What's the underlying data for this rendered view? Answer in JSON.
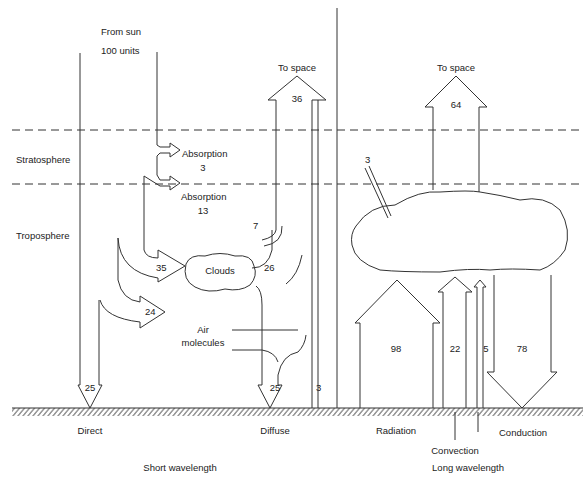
{
  "source": {
    "from_label": "From sun",
    "units_label": "100 units"
  },
  "layers": {
    "stratosphere": "Stratosphere",
    "troposphere": "Troposphere"
  },
  "short_wave": {
    "absorption_strat_label": "Absorption",
    "absorption_strat_value": "3",
    "absorption_trop_label": "Absorption",
    "absorption_trop_value": "13",
    "to_space_label": "To space",
    "to_space_value": "36",
    "cloud_reflect_value": "7",
    "to_clouds_value": "35",
    "clouds_label": "Clouds",
    "cloud_diffuse_value": "26",
    "to_air_value": "24",
    "air_label_1": "Air",
    "air_label_2": "molecules",
    "direct_value": "25",
    "diffuse_value": "25",
    "surface_reflect_value": "3",
    "direct_label": "Direct",
    "diffuse_label": "Diffuse",
    "section_label": "Short wavelength"
  },
  "long_wave": {
    "to_space_label": "To space",
    "to_space_value": "64",
    "absorbed_value": "3",
    "radiation_value": "98",
    "convection_value": "22",
    "conduction_value": "5",
    "back_radiation_value": "78",
    "radiation_label": "Radiation",
    "convection_label": "Convection",
    "conduction_label": "Conduction",
    "section_label": "Long wavelength"
  }
}
